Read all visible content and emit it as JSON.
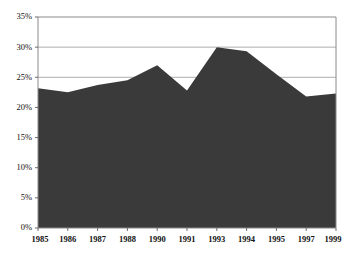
{
  "chart_data": {
    "type": "area",
    "title": "",
    "subtitle": "",
    "xlabel": "",
    "ylabel": "",
    "grid": true,
    "legend_position": "none",
    "series_color": "#3a3a3a",
    "axis_color": "#888888",
    "grid_color": "#999999",
    "ylim": [
      0,
      35
    ],
    "ytick_labels": [
      "0%",
      "5%",
      "10%",
      "15%",
      "20%",
      "25%",
      "30%",
      "35%"
    ],
    "ytick_values": [
      0,
      5,
      10,
      15,
      20,
      25,
      30,
      35
    ],
    "categories": [
      "1985",
      "1986",
      "1987",
      "1988",
      "1990",
      "1991",
      "1993",
      "1994",
      "1995",
      "1997",
      "1999"
    ],
    "values": [
      23.2,
      22.5,
      23.7,
      24.5,
      27.0,
      22.8,
      30.0,
      29.3,
      25.5,
      21.8,
      22.3
    ],
    "series": [
      {
        "name": "",
        "values": [
          23.2,
          22.5,
          23.7,
          24.5,
          27.0,
          22.8,
          30.0,
          29.3,
          25.5,
          21.8,
          22.3
        ]
      }
    ]
  }
}
